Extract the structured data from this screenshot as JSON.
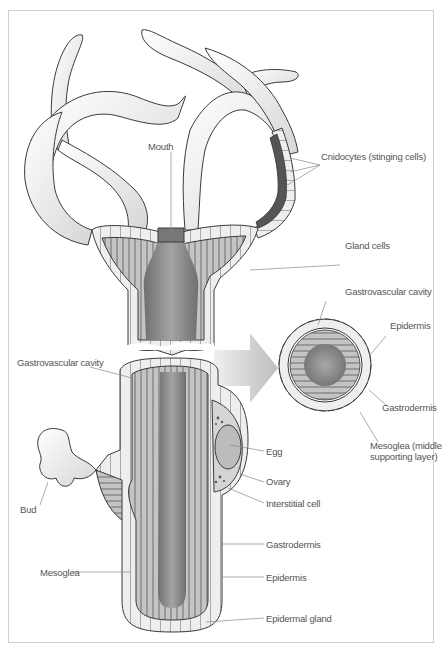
{
  "figure": {
    "colors": {
      "outline": "#3a3a3a",
      "tentacle_fill": "#f2f2f2",
      "epidermis_fill": "#ececec",
      "gastrodermis_fill": "#b9b9b9",
      "cavity_fill": "#8e8e8e",
      "arrow_fill": "#c8c8c8",
      "label_text": "#555555",
      "leader_line": "#888888",
      "frame_border": "#cfcfcf"
    },
    "labels": {
      "mouth": "Mouth",
      "cnidocytes": "Cnidocytes (stinging cells)",
      "gland_cells": "Gland cells",
      "cs_gastrovascular_cavity": "Gastrovascular cavity",
      "cs_epidermis": "Epidermis",
      "cs_gastrodermis": "Gastrodermis",
      "cs_mesoglea": "Mesoglea (middle supporting layer)",
      "gastrovascular_cavity": "Gastrovascular cavity",
      "egg": "Egg",
      "ovary": "Ovary",
      "interstitial_cell": "Interstitial cell",
      "bud": "Bud",
      "mesoglea": "Mesoglea",
      "gastrodermis": "Gastrodermis",
      "epidermis": "Epidermis",
      "epidermal_gland": "Epidermal gland"
    }
  }
}
